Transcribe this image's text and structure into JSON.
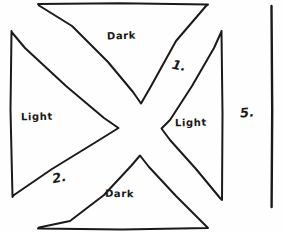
{
  "figure": {
    "background_color": "#fefefe",
    "ink_color": "#1c1a18",
    "regions": {
      "top": {
        "label": "Dark"
      },
      "left": {
        "label": "Light"
      },
      "right": {
        "label": "Light"
      },
      "bottom": {
        "label": "Dark"
      }
    },
    "annotations": {
      "upper_right_number": "1.",
      "lower_left_number": "2.",
      "outer_right_number": "5."
    }
  }
}
